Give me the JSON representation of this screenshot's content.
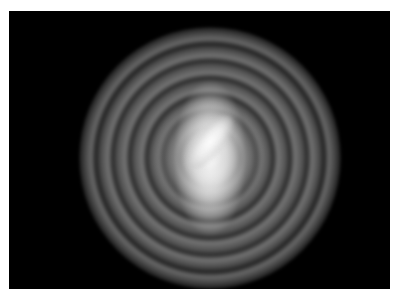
{
  "image": {
    "subject": "barred spiral galaxy",
    "description": "Grayscale illustration of a barred spiral galaxy viewed face-on with a bright central bar and multiple spiral arms on a black background, framed by a thin white border",
    "background_color": "#000000",
    "border_color": "#ffffff",
    "core_color": "#ffffff",
    "arm_color": "#9a9a9a"
  }
}
